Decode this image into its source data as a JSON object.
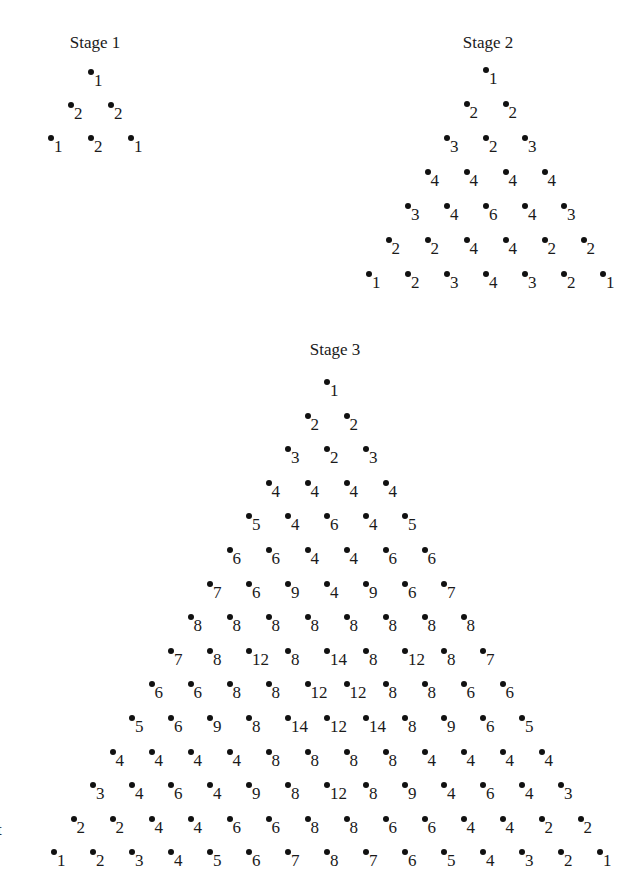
{
  "stages": [
    {
      "title": "Stage 1",
      "title_pos": [
        95,
        33
      ],
      "apex": [
        91,
        72
      ],
      "dx": 40,
      "dy": 33,
      "rows": [
        [
          "1"
        ],
        [
          "2",
          "2"
        ],
        [
          "1",
          "2",
          "1"
        ]
      ]
    },
    {
      "title": "Stage 2",
      "title_pos": [
        488,
        33
      ],
      "apex": [
        486,
        70
      ],
      "dx": 39,
      "dy": 34,
      "rows": [
        [
          "1"
        ],
        [
          "2",
          "2"
        ],
        [
          "3",
          "2",
          "3"
        ],
        [
          "4",
          "4",
          "4",
          "4"
        ],
        [
          "3",
          "4",
          "6",
          "4",
          "3"
        ],
        [
          "2",
          "2",
          "4",
          "4",
          "2",
          "2"
        ],
        [
          "1",
          "2",
          "3",
          "4",
          "3",
          "2",
          "1"
        ]
      ]
    },
    {
      "title": "Stage 3",
      "title_pos": [
        335,
        340
      ],
      "apex": [
        327,
        382
      ],
      "dx": 39,
      "dy": 33.6,
      "rows": [
        [
          "1"
        ],
        [
          "2",
          "2"
        ],
        [
          "3",
          "2",
          "3"
        ],
        [
          "4",
          "4",
          "4",
          "4"
        ],
        [
          "5",
          "4",
          "6",
          "4",
          "5"
        ],
        [
          "6",
          "6",
          "4",
          "4",
          "6",
          "6"
        ],
        [
          "7",
          "6",
          "9",
          "4",
          "9",
          "6",
          "7"
        ],
        [
          "8",
          "8",
          "8",
          "8",
          "8",
          "8",
          "8",
          "8"
        ],
        [
          "7",
          "8",
          "12",
          "8",
          "14",
          "8",
          "12",
          "8",
          "7"
        ],
        [
          "6",
          "6",
          "8",
          "8",
          "12",
          "12",
          "8",
          "8",
          "6",
          "6"
        ],
        [
          "5",
          "6",
          "9",
          "8",
          "14",
          "12",
          "14",
          "8",
          "9",
          "6",
          "5"
        ],
        [
          "4",
          "4",
          "4",
          "4",
          "8",
          "8",
          "8",
          "8",
          "4",
          "4",
          "4",
          "4"
        ],
        [
          "3",
          "4",
          "6",
          "4",
          "9",
          "8",
          "12",
          "8",
          "9",
          "4",
          "6",
          "4",
          "3"
        ],
        [
          "2",
          "2",
          "4",
          "4",
          "6",
          "6",
          "8",
          "8",
          "6",
          "6",
          "4",
          "4",
          "2",
          "2"
        ],
        [
          "1",
          "2",
          "3",
          "4",
          "5",
          "6",
          "7",
          "8",
          "7",
          "6",
          "5",
          "4",
          "3",
          "2",
          "1"
        ]
      ]
    }
  ],
  "stray_mark": "t"
}
